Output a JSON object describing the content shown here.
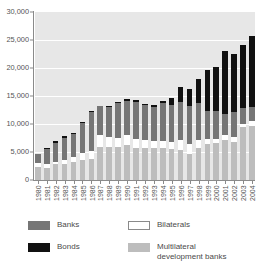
{
  "chart_data": {
    "type": "bar",
    "stacked": true,
    "title": "",
    "subtitle": "",
    "xlabel": "",
    "ylabel": "",
    "ylim": [
      0,
      30000
    ],
    "ytick_values": [
      0,
      5000,
      10000,
      15000,
      20000,
      25000,
      30000
    ],
    "ytick_labels": [
      "0",
      "5,000",
      "10,000",
      "15,000",
      "20,000",
      "25,000",
      "30,000"
    ],
    "grid": true,
    "legend_position": "bottom",
    "categories": [
      "1980",
      "1981",
      "1982",
      "1983",
      "1984",
      "1985",
      "1986",
      "1987",
      "1988",
      "1989",
      "1990",
      "1991",
      "1992",
      "1993",
      "1994",
      "1995",
      "1996",
      "1997",
      "1998",
      "1999",
      "2000",
      "2001",
      "2002",
      "2003",
      "2004"
    ],
    "series": [
      {
        "name": "Multilateral development banks",
        "color": "#bdbdbd",
        "stack_order": 1,
        "values": [
          2400,
          2100,
          2800,
          2900,
          3300,
          3500,
          3800,
          5900,
          5900,
          5900,
          6300,
          5800,
          5700,
          5800,
          5800,
          5500,
          5400,
          4600,
          5800,
          6400,
          6600,
          7200,
          6700,
          9400,
          9700
        ]
      },
      {
        "name": "Bilaterals",
        "color": "#ffffff",
        "stack_order": 2,
        "values": [
          700,
          700,
          400,
          600,
          800,
          1400,
          1300,
          2100,
          1700,
          1600,
          1800,
          1500,
          1400,
          1100,
          1100,
          1300,
          1800,
          1900,
          1400,
          900,
          800,
          900,
          1000,
          600,
          800
        ]
      },
      {
        "name": "Banks",
        "color": "#767676",
        "stack_order": 3,
        "values": [
          1500,
          2800,
          3500,
          4000,
          4200,
          5200,
          7000,
          5200,
          5500,
          6300,
          6100,
          6600,
          6300,
          6100,
          6800,
          6600,
          6700,
          6800,
          6600,
          5100,
          5000,
          3700,
          4400,
          2900,
          2600
        ]
      },
      {
        "name": "Bonds",
        "color": "#111111",
        "stack_order": 4,
        "values": [
          100,
          200,
          200,
          300,
          100,
          200,
          200,
          100,
          200,
          200,
          300,
          400,
          200,
          400,
          400,
          1300,
          2700,
          2900,
          4300,
          7300,
          7800,
          11200,
          10400,
          11300,
          12600
        ]
      }
    ],
    "totals": [
      4700,
      5800,
      6900,
      7800,
      8400,
      10300,
      12300,
      13300,
      13300,
      14000,
      14500,
      14300,
      13600,
      13400,
      14100,
      14700,
      16600,
      16200,
      18100,
      19700,
      20200,
      23000,
      22500,
      24200,
      25700
    ]
  },
  "legend": {
    "items": [
      {
        "key": "banks",
        "label": "Banks",
        "color": "#767676"
      },
      {
        "key": "bonds",
        "label": "Bonds",
        "color": "#111111"
      },
      {
        "key": "bilaterals",
        "label": "Bilaterals",
        "color": "#ffffff"
      },
      {
        "key": "mdb",
        "label": "Multilateral\ndevelopment banks",
        "color": "#bdbdbd"
      }
    ]
  }
}
